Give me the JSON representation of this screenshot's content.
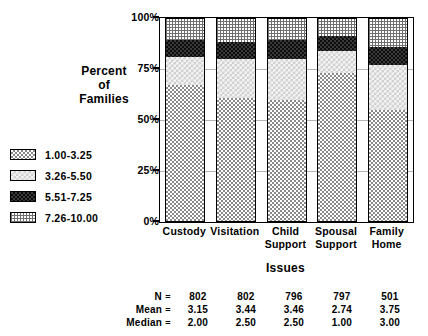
{
  "chart_data": {
    "type": "bar",
    "subtype": "stacked-percent",
    "title": "",
    "xlabel": "Issues",
    "ylabel": "Percent of Families",
    "ylabel_lines": [
      "Percent",
      "of",
      "Families"
    ],
    "ylim": [
      0,
      100
    ],
    "yticks": [
      0,
      25,
      50,
      75,
      100
    ],
    "ytick_labels": [
      "0%",
      "25%",
      "50%",
      "75%",
      "100%"
    ],
    "grid": true,
    "legend_position": "left",
    "categories": [
      "Custody",
      "Visitation",
      "Child Support",
      "Spousal Support",
      "Family Home"
    ],
    "category_label_lines": [
      [
        "Custody"
      ],
      [
        "Visitation"
      ],
      [
        "Child",
        "Support"
      ],
      [
        "Spousal",
        "Support"
      ],
      [
        "Family",
        "Home"
      ]
    ],
    "series": [
      {
        "name": "1.00-3.25",
        "values": [
          67,
          61,
          60,
          73,
          55
        ]
      },
      {
        "name": "3.26-5.50",
        "values": [
          14,
          19,
          20,
          11,
          22
        ]
      },
      {
        "name": "5.51-7.25",
        "values": [
          8,
          8,
          9,
          7,
          9
        ]
      },
      {
        "name": "7.26-10.00",
        "values": [
          11,
          12,
          11,
          9,
          14
        ]
      }
    ],
    "cumulative_tops": [
      [
        67,
        81,
        89,
        100
      ],
      [
        61,
        80,
        88,
        100
      ],
      [
        60,
        80,
        89,
        100
      ],
      [
        73,
        84,
        91,
        100
      ],
      [
        55,
        77,
        86,
        100
      ]
    ],
    "annotations_table": {
      "row_labels": [
        "N",
        "Mean",
        "Median"
      ],
      "separator": "=",
      "rows": [
        {
          "label": "N",
          "values": [
            "802",
            "802",
            "796",
            "797",
            "501"
          ]
        },
        {
          "label": "Mean",
          "values": [
            "3.15",
            "3.44",
            "3.46",
            "2.74",
            "3.75"
          ]
        },
        {
          "label": "Median",
          "values": [
            "2.00",
            "2.50",
            "2.50",
            "1.00",
            "3.00"
          ]
        }
      ]
    }
  },
  "legend": {
    "items": [
      {
        "label": "1.00-3.25",
        "pattern": "medium-checkerboard"
      },
      {
        "label": "3.26-5.50",
        "pattern": "light-sparse-dots"
      },
      {
        "label": "5.51-7.25",
        "pattern": "dark-dense-checkerboard"
      },
      {
        "label": "7.26-10.00",
        "pattern": "fine-grid-hatch"
      }
    ]
  }
}
